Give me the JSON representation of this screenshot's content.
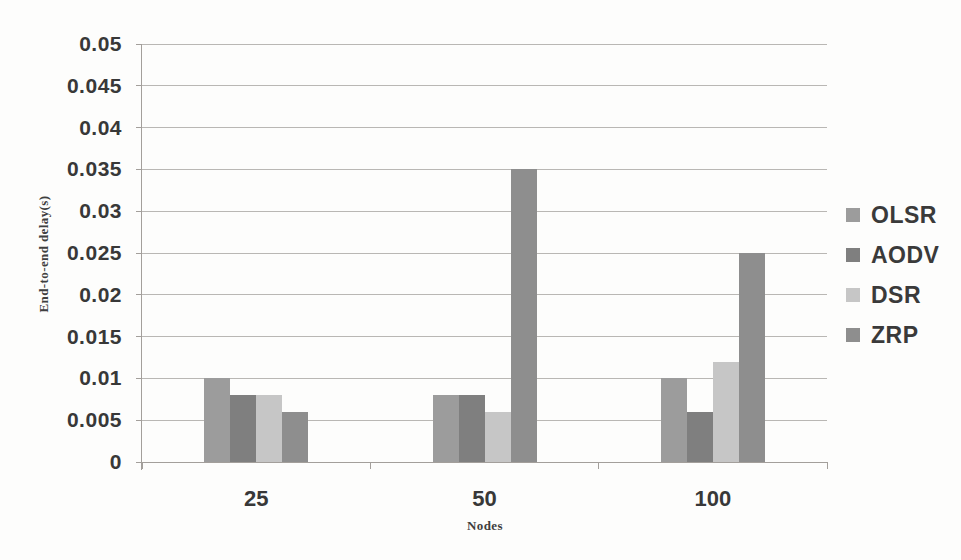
{
  "chart_data": {
    "type": "bar",
    "title": "",
    "xlabel": "Nodes",
    "ylabel": "End-to-end delay(s)",
    "categories": [
      "25",
      "50",
      "100"
    ],
    "series": [
      {
        "name": "OLSR",
        "color": "#9c9c9c",
        "values": [
          0.01,
          0.008,
          0.01
        ]
      },
      {
        "name": "AODV",
        "color": "#7f7f7f",
        "values": [
          0.008,
          0.008,
          0.006
        ]
      },
      {
        "name": "DSR",
        "color": "#c6c6c6",
        "values": [
          0.008,
          0.006,
          0.012
        ]
      },
      {
        "name": "ZRP",
        "color": "#8e8e8e",
        "values": [
          0.006,
          0.035,
          0.025
        ]
      }
    ],
    "ylim": [
      0,
      0.05
    ],
    "ytick_step": 0.005,
    "yticks": [
      "0",
      "0.005",
      "0.01",
      "0.015",
      "0.02",
      "0.025",
      "0.03",
      "0.035",
      "0.04",
      "0.045",
      "0.05"
    ],
    "grid": true,
    "legend_position": "right",
    "colors": {
      "gridline": "#b9b7b4",
      "axis": "#a39f9b",
      "text": "#383838"
    }
  }
}
